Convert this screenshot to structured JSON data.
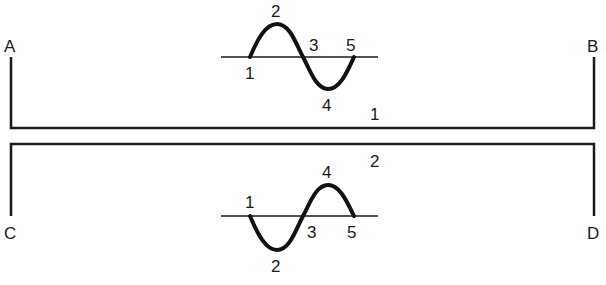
{
  "diagram": {
    "colors": {
      "ink": "#1a1a1a",
      "background": "#ffffff"
    },
    "terminals": {
      "A": "A",
      "B": "B",
      "C": "C",
      "D": "D"
    },
    "lines": [
      {
        "id": "line-1",
        "label": "1",
        "from": "A",
        "to": "B"
      },
      {
        "id": "line-2",
        "label": "2",
        "from": "C",
        "to": "D"
      }
    ],
    "waves": [
      {
        "id": "top-wave",
        "phase": "positive-first",
        "point_labels": [
          "1",
          "2",
          "3",
          "4",
          "5"
        ]
      },
      {
        "id": "bottom-wave",
        "phase": "negative-first",
        "point_labels": [
          "1",
          "2",
          "3",
          "4",
          "5"
        ]
      }
    ]
  }
}
